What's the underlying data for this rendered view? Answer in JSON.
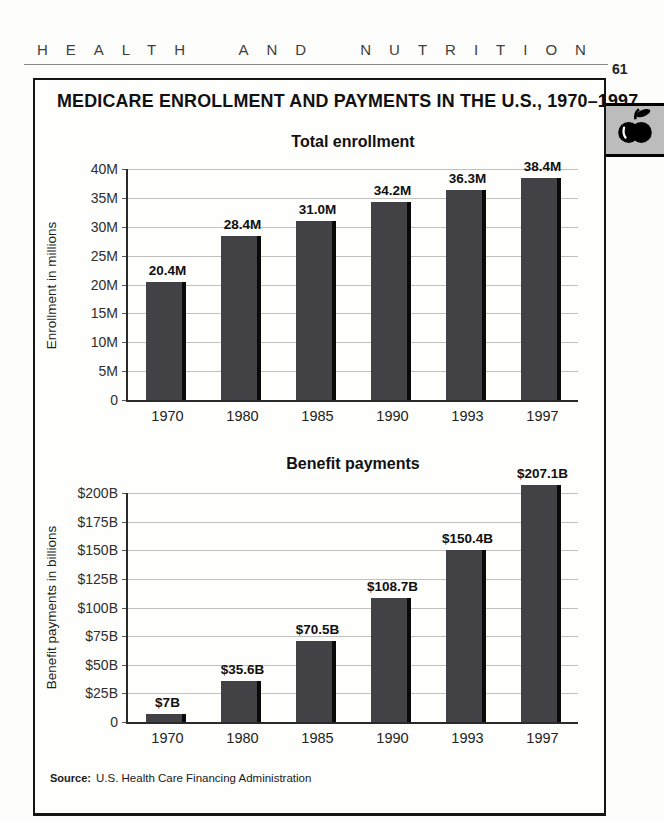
{
  "page": {
    "kicker": "HEALTH AND NUTRITION",
    "page_number": "61",
    "title": "MEDICARE ENROLLMENT AND PAYMENTS IN THE U.S., 1970–1997",
    "source": {
      "label": "Source:",
      "text": "U.S. Health Care Financing Administration"
    },
    "tab_icon": "apple-icon",
    "colors": {
      "bar": "#414146",
      "bar_shadow": "#0a0a0a",
      "grid": "#c1c0be",
      "axis": "#2a2a2a",
      "tab_bg": "#bcbcbc"
    }
  },
  "chart_data": [
    {
      "type": "bar",
      "title": "Total enrollment",
      "ylabel": "Enrollment in millions",
      "xlabel": "",
      "categories": [
        "1970",
        "1980",
        "1985",
        "1990",
        "1993",
        "1997"
      ],
      "values": [
        20.4,
        28.4,
        31.0,
        34.2,
        36.3,
        38.4
      ],
      "value_labels": [
        "20.4M",
        "28.4M",
        "31.0M",
        "34.2M",
        "36.3M",
        "38.4M"
      ],
      "ylim": [
        0,
        40
      ],
      "yticks": [
        {
          "label": "0",
          "value": 0
        },
        {
          "label": "5M",
          "value": 5
        },
        {
          "label": "10M",
          "value": 10
        },
        {
          "label": "15M",
          "value": 15
        },
        {
          "label": "20M",
          "value": 20
        },
        {
          "label": "25M",
          "value": 25
        },
        {
          "label": "30M",
          "value": 30
        },
        {
          "label": "35M",
          "value": 35
        },
        {
          "label": "40M",
          "value": 40
        }
      ],
      "grid": true,
      "legend": false
    },
    {
      "type": "bar",
      "title": "Benefit payments",
      "ylabel": "Benefit payments in billions",
      "xlabel": "",
      "categories": [
        "1970",
        "1980",
        "1985",
        "1990",
        "1993",
        "1997"
      ],
      "values": [
        7,
        35.6,
        70.5,
        108.7,
        150.4,
        207.1
      ],
      "value_labels": [
        "$7B",
        "$35.6B",
        "$70.5B",
        "$108.7B",
        "$150.4B",
        "$207.1B"
      ],
      "ylim": [
        0,
        200
      ],
      "yticks": [
        {
          "label": "0",
          "value": 0
        },
        {
          "label": "$25B",
          "value": 25
        },
        {
          "label": "$50B",
          "value": 50
        },
        {
          "label": "$75B",
          "value": 75
        },
        {
          "label": "$100B",
          "value": 100
        },
        {
          "label": "$125B",
          "value": 125
        },
        {
          "label": "$150B",
          "value": 150
        },
        {
          "label": "$175B",
          "value": 175
        },
        {
          "label": "$200B",
          "value": 200
        }
      ],
      "grid": true,
      "legend": false
    }
  ]
}
